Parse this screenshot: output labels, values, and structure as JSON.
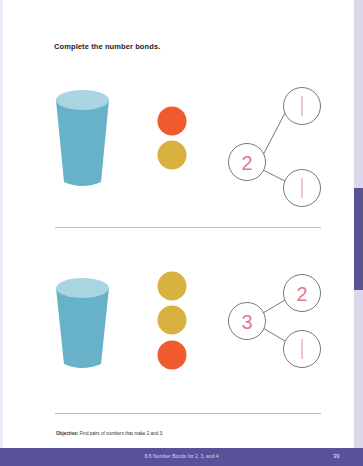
{
  "page": {
    "instruction": "Complete the number bonds.",
    "objective_label": "Objective:",
    "objective_text": "Find pairs of numbers that make 2 and 3.",
    "footer_title": "8-5 Number Bonds for 2, 3, and 4",
    "page_number": "39"
  },
  "colors": {
    "cup": "#6bb4cc",
    "cup_top": "#a8d4e2",
    "red_counter": "#f05a2f",
    "yellow_counter": "#d9b13e",
    "bond_number": "#e07a8f",
    "footer": "#57529a",
    "side_tab": "#5a5495"
  },
  "problems": [
    {
      "counters": [
        "red",
        "yellow"
      ],
      "bond": {
        "whole": "2",
        "part_top": "1",
        "part_bottom": "1"
      }
    },
    {
      "counters": [
        "yellow",
        "yellow",
        "red"
      ],
      "bond": {
        "whole": "3",
        "part_top": "2",
        "part_bottom": "1"
      }
    }
  ]
}
